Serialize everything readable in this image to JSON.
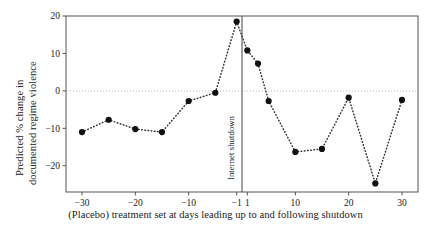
{
  "figure": {
    "y_axis_label_line1": "Predicted % change in",
    "y_axis_label_line2": "documented regime violence",
    "x_axis_label": "(Placebo) treatment set at days leading up to and following shutdown",
    "vertical_line_label": "Internet shutdown",
    "colors": {
      "marker": "#111111",
      "line": "#333333",
      "axis": "#555555",
      "zero_line": "#bbbbbb",
      "background": "#ffffff",
      "text": "#222222"
    }
  },
  "chart_data": {
    "type": "scatter",
    "title": "",
    "subtitle": "",
    "xlabel": "(Placebo) treatment set at days leading up to and following shutdown",
    "ylabel": "Predicted % change in documented regime violence",
    "xlim": [
      -33,
      33
    ],
    "ylim": [
      -27,
      20
    ],
    "grid": false,
    "legend": null,
    "line_style": "dotted",
    "marker_style": "filled-circle",
    "x_ticks": [
      -30,
      -20,
      -10,
      -1,
      1,
      10,
      20,
      30
    ],
    "x_tick_labels": [
      "−30",
      "−20",
      "−10",
      "−1",
      "1",
      "10",
      "20",
      "30"
    ],
    "y_ticks": [
      20,
      10,
      0,
      -10,
      -20
    ],
    "y_tick_labels": [
      "20",
      "10",
      "0",
      "−10",
      "−20"
    ],
    "zero_reference_line": 0,
    "annotations": [
      {
        "type": "vline",
        "x": 0,
        "label": "Internet shutdown"
      }
    ],
    "x": [
      -30,
      -25,
      -20,
      -15,
      -10,
      -5,
      -1,
      1,
      3,
      5,
      10,
      15,
      20,
      25,
      30
    ],
    "values": [
      -11.0,
      -7.7,
      -10.2,
      -11.0,
      -2.7,
      -0.5,
      18.5,
      10.8,
      7.3,
      -2.7,
      -16.3,
      -15.5,
      -1.8,
      -24.7,
      -2.4
    ],
    "points": [
      {
        "x": -30,
        "y": -11.0
      },
      {
        "x": -25,
        "y": -7.7
      },
      {
        "x": -20,
        "y": -10.2
      },
      {
        "x": -15,
        "y": -11.0
      },
      {
        "x": -10,
        "y": -2.7
      },
      {
        "x": -5,
        "y": -0.5
      },
      {
        "x": -1,
        "y": 18.5
      },
      {
        "x": 1,
        "y": 10.8
      },
      {
        "x": 3,
        "y": 7.3
      },
      {
        "x": 5,
        "y": -2.7
      },
      {
        "x": 10,
        "y": -16.3
      },
      {
        "x": 15,
        "y": -15.5
      },
      {
        "x": 20,
        "y": -1.8
      },
      {
        "x": 25,
        "y": -24.7
      },
      {
        "x": 30,
        "y": -2.4
      }
    ]
  }
}
